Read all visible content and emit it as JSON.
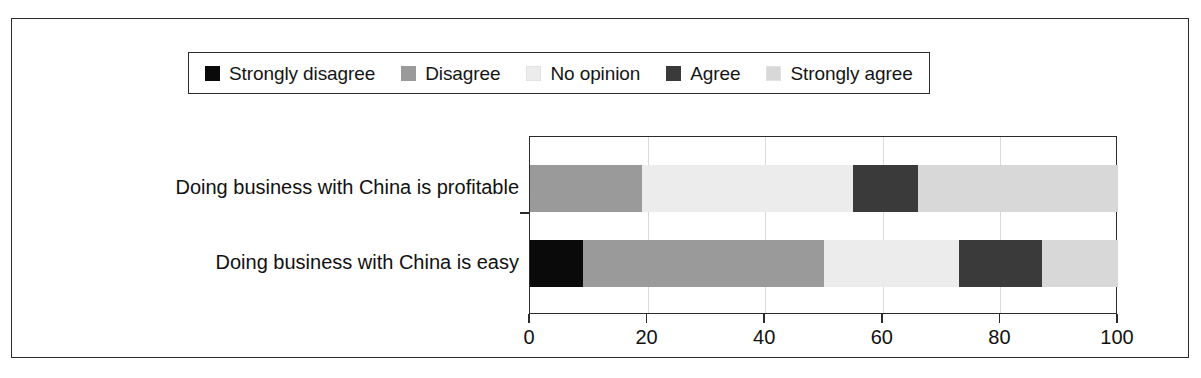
{
  "chart_data": {
    "type": "bar",
    "orientation": "horizontal",
    "stacked": true,
    "stacked_mode": "percent",
    "title": "",
    "subtitle": "",
    "xlabel": "",
    "ylabel": "",
    "xlim": [
      0,
      100
    ],
    "xticks": [
      0,
      20,
      40,
      60,
      80,
      100
    ],
    "xtick_labels": [
      "0",
      "20",
      "40",
      "60",
      "80",
      "100"
    ],
    "grid": true,
    "grid_axis": "x",
    "legend_position": "top",
    "categories": [
      "Doing business with China is profitable",
      "Doing business with China is easy"
    ],
    "series": [
      {
        "name": "Strongly disagree",
        "color": "#0a0a0a",
        "values": [
          0,
          9
        ]
      },
      {
        "name": "Disagree",
        "color": "#9a9a9a",
        "values": [
          19,
          41
        ]
      },
      {
        "name": "No opinion",
        "color": "#ececec",
        "values": [
          36,
          23
        ]
      },
      {
        "name": "Agree",
        "color": "#3a3a3a",
        "values": [
          11,
          14
        ]
      },
      {
        "name": "Strongly agree",
        "color": "#d8d8d8",
        "values": [
          34,
          13
        ]
      }
    ]
  },
  "legend": {
    "entries": [
      {
        "label": "Strongly disagree",
        "color": "#0a0a0a"
      },
      {
        "label": "Disagree",
        "color": "#9a9a9a"
      },
      {
        "label": "No opinion",
        "color": "#ececec"
      },
      {
        "label": "Agree",
        "color": "#3a3a3a"
      },
      {
        "label": "Strongly agree",
        "color": "#d8d8d8"
      }
    ]
  },
  "axis": {
    "tick_labels": [
      "0",
      "20",
      "40",
      "60",
      "80",
      "100"
    ]
  },
  "colors": {
    "frame": "#2b2b2b",
    "grid": "#d9d9d9",
    "background": "#ffffff",
    "text": "#111111"
  }
}
